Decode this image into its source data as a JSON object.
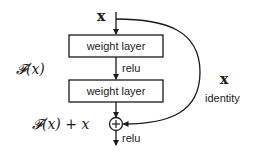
{
  "diagram": {
    "input_label": "x",
    "layers": [
      {
        "label": "weight layer"
      },
      {
        "label": "weight layer"
      }
    ],
    "activation_mid": "relu",
    "activation_out": "relu",
    "residual_function_label": "𝓕(x)",
    "sum_label": "𝓕(x) + x",
    "sum_symbol": "+",
    "shortcut": {
      "variable": "x",
      "label": "identity"
    },
    "colors": {
      "stroke": "#1a1a1a",
      "text": "#1a1a1a",
      "background": "#ffffff"
    }
  }
}
